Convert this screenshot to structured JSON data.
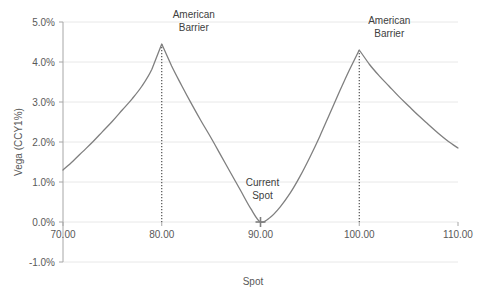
{
  "chart_data": {
    "type": "line",
    "title": "",
    "xlabel": "Spot",
    "ylabel": "Vega (CCY1%)",
    "xlim": [
      70,
      110
    ],
    "ylim": [
      -1.0,
      5.0
    ],
    "grid": true,
    "legend": "none",
    "x_ticks": [
      "70.00",
      "80.00",
      "90.00",
      "100.00",
      "110.00"
    ],
    "x_tick_values": [
      70,
      80,
      90,
      100,
      110
    ],
    "y_ticks": [
      "-1.0%",
      "0.0%",
      "1.0%",
      "2.0%",
      "3.0%",
      "4.0%",
      "5.0%"
    ],
    "y_tick_values": [
      -1.0,
      0.0,
      1.0,
      2.0,
      3.0,
      4.0,
      5.0
    ],
    "series": [
      {
        "name": "Vega",
        "x": [
          70.0,
          71.0,
          72.0,
          73.0,
          74.0,
          75.0,
          76.0,
          77.0,
          78.0,
          79.0,
          80.0,
          81.0,
          82.0,
          83.0,
          84.0,
          85.0,
          86.0,
          87.0,
          88.0,
          89.0,
          90.0,
          91.0,
          92.0,
          93.0,
          94.0,
          95.0,
          96.0,
          97.0,
          98.0,
          99.0,
          100.0,
          101.0,
          102.0,
          103.0,
          104.0,
          105.0,
          106.0,
          107.0,
          108.0,
          109.0,
          110.0
        ],
        "y": [
          1.3,
          1.52,
          1.76,
          2.0,
          2.26,
          2.52,
          2.8,
          3.08,
          3.4,
          3.82,
          4.45,
          3.9,
          3.42,
          2.96,
          2.52,
          2.1,
          1.66,
          1.22,
          0.78,
          0.34,
          0.0,
          0.12,
          0.38,
          0.72,
          1.14,
          1.62,
          2.14,
          2.7,
          3.26,
          3.8,
          4.3,
          3.95,
          3.66,
          3.4,
          3.14,
          2.9,
          2.66,
          2.44,
          2.22,
          2.02,
          1.85
        ]
      }
    ],
    "annotations": [
      {
        "name": "left-barrier",
        "label_line1": "American",
        "label_line2": "Barrier",
        "x": 80,
        "y": 4.45,
        "marker": "dotted-vline"
      },
      {
        "name": "current-spot",
        "label_line1": "Current",
        "label_line2": "Spot",
        "x": 90,
        "y": 0.0,
        "marker": "cross"
      },
      {
        "name": "right-barrier",
        "label_line1": "American",
        "label_line2": "Barrier",
        "x": 100,
        "y": 4.3,
        "marker": "dotted-vline"
      }
    ],
    "colors": {
      "line": "#7f7f7f",
      "grid": "#e8e8e8",
      "axis": "#a6a6a6",
      "text": "#595959",
      "marker": "#7f7f7f"
    }
  }
}
